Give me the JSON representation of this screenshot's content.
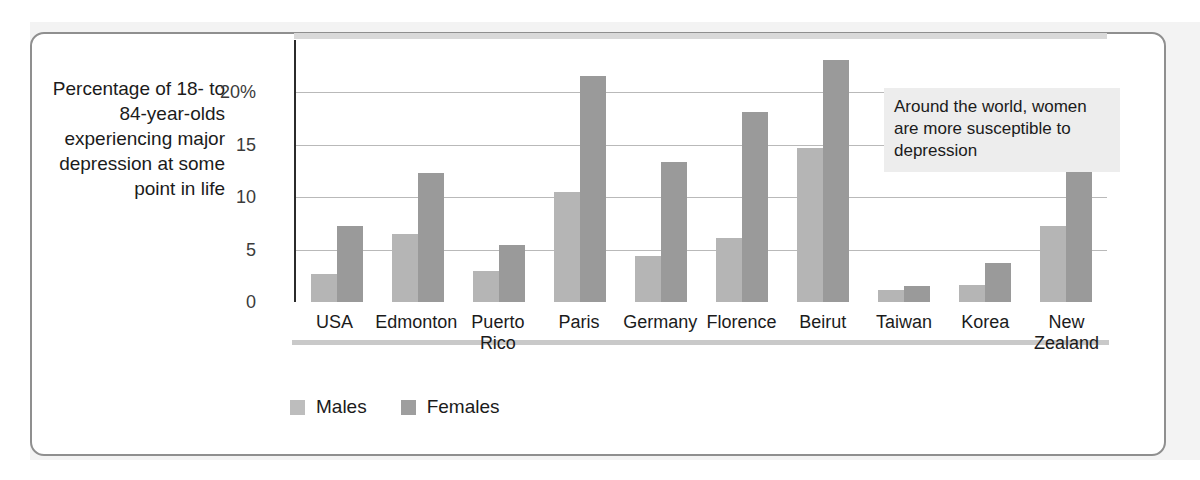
{
  "figure": {
    "axis_caption": "Percentage of 18- to 84-year-olds experiencing major depression at some point in life",
    "annotation": "Around the world, women are more susceptible to depression"
  },
  "legend": {
    "position": "bottom-left",
    "items": [
      {
        "label": "Males",
        "color": "#bdbdbd"
      },
      {
        "label": "Females",
        "color": "#9e9e9e"
      }
    ]
  },
  "chart_data": {
    "type": "bar",
    "title": "",
    "subtitle": "",
    "xlabel": "",
    "ylabel": "Percentage of 18- to 84-year-olds experiencing major depression at some point in life",
    "ylim": [
      0,
      25
    ],
    "yticks": [
      0,
      5,
      10,
      15,
      20
    ],
    "ytick_labels": [
      "0",
      "5",
      "10",
      "15",
      "20%"
    ],
    "grid": "horizontal",
    "annotations": [
      "Around the world, women are more susceptible to depression"
    ],
    "categories": [
      "USA",
      "Edmonton",
      "Puerto Rico",
      "Paris",
      "Germany",
      "Florence",
      "Beirut",
      "Taiwan",
      "Korea",
      "New Zealand"
    ],
    "series": [
      {
        "name": "Males",
        "color": "#b5b5b5",
        "values": [
          2.7,
          6.5,
          3.0,
          10.5,
          4.4,
          6.1,
          14.7,
          1.1,
          1.6,
          7.3
        ]
      },
      {
        "name": "Females",
        "color": "#9a9a9a",
        "values": [
          7.3,
          12.3,
          5.4,
          21.6,
          13.4,
          18.1,
          23.1,
          1.5,
          3.7,
          15.3
        ]
      }
    ]
  },
  "colors": {
    "frame_border": "#8f8f8f",
    "page_background": "#f3f3f3",
    "plot_background": "#ffffff",
    "gridline": "#b9b9b9",
    "annotation_background": "#ededed",
    "text": "#1b1b1b"
  }
}
